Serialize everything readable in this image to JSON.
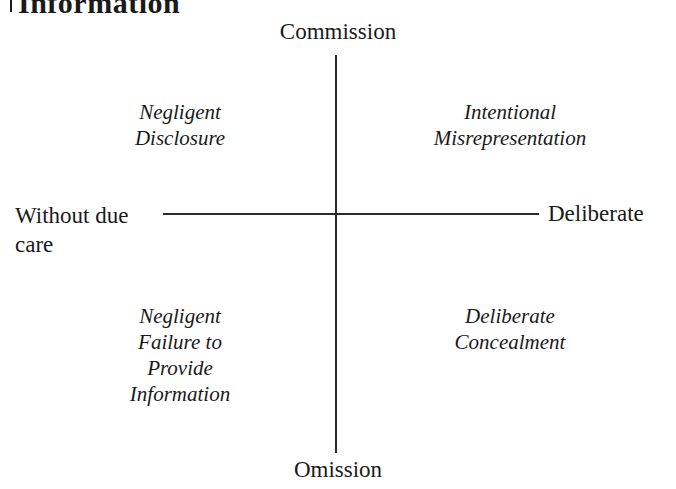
{
  "heading": {
    "text": "Information"
  },
  "axes": {
    "vertical": {
      "top_label": "Commission",
      "bottom_label": "Omission"
    },
    "horizontal": {
      "left_label": "Without due care",
      "right_label": "Deliberate"
    }
  },
  "quadrants": {
    "top_left": {
      "lines": [
        "Negligent",
        "Disclosure"
      ]
    },
    "top_right": {
      "lines": [
        "Intentional",
        "Misrepresentation"
      ]
    },
    "bottom_left": {
      "lines": [
        "Negligent",
        "Failure to",
        "Provide",
        "Information"
      ]
    },
    "bottom_right": {
      "lines": [
        "Deliberate",
        "Concealment"
      ]
    }
  },
  "colors": {
    "text": "#1a1a1a",
    "lines": "#2a2a2a",
    "background": "#ffffff"
  }
}
